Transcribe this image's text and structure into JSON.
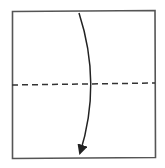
{
  "diagram": {
    "type": "origami-fold-step",
    "colors": {
      "background": "#ffffff",
      "paper_edge": "#555555",
      "fold_line": "#333333",
      "arrow": "#222222"
    },
    "paper": {
      "x1": 12,
      "y1": 11,
      "x2": 155,
      "y2": 158
    },
    "fold_line": {
      "style": "dashed",
      "y_left": 85,
      "y_right": 83
    },
    "arrow": {
      "from": [
        79,
        13
      ],
      "control": [
        100,
        84
      ],
      "to": [
        80,
        155
      ],
      "direction": "down"
    }
  }
}
